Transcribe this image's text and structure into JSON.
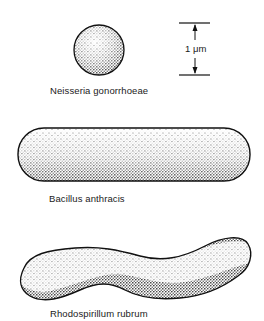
{
  "figure": {
    "organisms": [
      {
        "name": "Neisseria gonorrhoeae",
        "shape": "coccus"
      },
      {
        "name": "Bacillus anthracis",
        "shape": "rod"
      },
      {
        "name": "Rhodospirillum rubrum",
        "shape": "spirillum"
      }
    ],
    "scale_bar": {
      "label": "1 μm"
    },
    "colors": {
      "ink": "#111111",
      "background": "#ffffff"
    }
  }
}
